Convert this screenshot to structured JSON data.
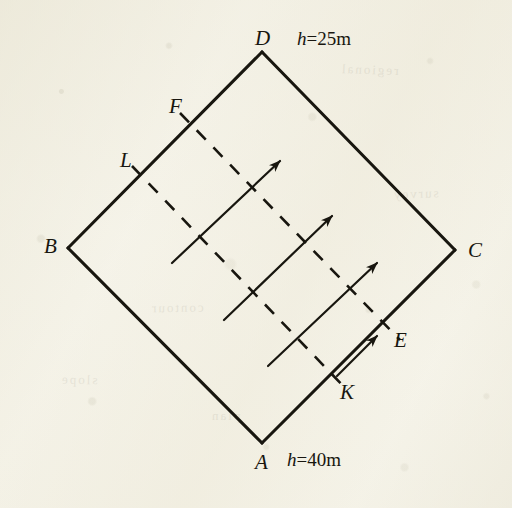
{
  "figure": {
    "background_color": "#f4f2e7",
    "ink_color": "#18160f",
    "vertices": [
      {
        "id": "D",
        "label": "D",
        "x": 262,
        "y": 52,
        "label_x": 255,
        "label_y": 28,
        "position": "top"
      },
      {
        "id": "B",
        "label": "B",
        "x": 68,
        "y": 248,
        "label_x": 44,
        "label_y": 236,
        "position": "left"
      },
      {
        "id": "C",
        "label": "C",
        "x": 455,
        "y": 250,
        "label_x": 468,
        "label_y": 240,
        "position": "right"
      },
      {
        "id": "A",
        "label": "A",
        "x": 262,
        "y": 443,
        "label_x": 255,
        "label_y": 452,
        "position": "bottom"
      }
    ],
    "edges": [
      {
        "from": "D",
        "to": "B",
        "style": "solid"
      },
      {
        "from": "B",
        "to": "A",
        "style": "solid"
      },
      {
        "from": "A",
        "to": "C",
        "style": "solid"
      },
      {
        "from": "C",
        "to": "D",
        "style": "solid"
      }
    ],
    "points": [
      {
        "id": "F",
        "label": "F",
        "x": 180,
        "y": 113,
        "label_x": 169,
        "label_y": 96,
        "on_edge": "DB"
      },
      {
        "id": "L",
        "label": "L",
        "x": 132,
        "y": 166,
        "label_x": 120,
        "label_y": 150,
        "on_edge": "DB"
      },
      {
        "id": "E",
        "label": "E",
        "x": 400,
        "y": 340,
        "label_x": 394,
        "label_y": 330,
        "on_edge": "AC"
      },
      {
        "id": "K",
        "label": "K",
        "x": 348,
        "y": 391,
        "label_x": 340,
        "label_y": 382,
        "on_edge": "AC"
      }
    ],
    "dashed_lines": [
      {
        "id": "FE",
        "from": "F",
        "to": "E",
        "x1": 180,
        "y1": 113,
        "x2": 400,
        "y2": 340,
        "style": "dashed"
      },
      {
        "id": "LK",
        "from": "L",
        "to": "K",
        "x1": 132,
        "y1": 166,
        "x2": 348,
        "y2": 391,
        "style": "dashed"
      }
    ],
    "arrows": [
      {
        "id": "arrow-1",
        "x1": 172,
        "y1": 263,
        "x2": 280,
        "y2": 161,
        "direction": "up-right"
      },
      {
        "id": "arrow-2",
        "x1": 224,
        "y1": 320,
        "x2": 332,
        "y2": 216,
        "direction": "up-right"
      },
      {
        "id": "arrow-3",
        "x1": 268,
        "y1": 366,
        "x2": 377,
        "y2": 263,
        "direction": "up-right"
      },
      {
        "id": "arrow-4",
        "x1": 337,
        "y1": 376,
        "x2": 377,
        "y2": 336,
        "direction": "up-right"
      }
    ],
    "annotations": [
      {
        "id": "h-top",
        "text": "h=25m",
        "prefix": "h",
        "body": "=25m",
        "x": 297,
        "y": 29,
        "near_vertex": "D"
      },
      {
        "id": "h-bottom",
        "text": "h=40m",
        "prefix": "h",
        "body": "=40m",
        "x": 287,
        "y": 450,
        "near_vertex": "A"
      }
    ]
  },
  "show_through": [
    {
      "text": "regional",
      "x": 340,
      "y": 62,
      "rot": -2
    },
    {
      "text": "contour",
      "x": 150,
      "y": 300,
      "rot": 1
    },
    {
      "text": "slope",
      "x": 60,
      "y": 372,
      "rot": -1
    },
    {
      "text": "survey",
      "x": 392,
      "y": 186,
      "rot": 2
    },
    {
      "text": "plan",
      "x": 210,
      "y": 408,
      "rot": 0
    }
  ]
}
